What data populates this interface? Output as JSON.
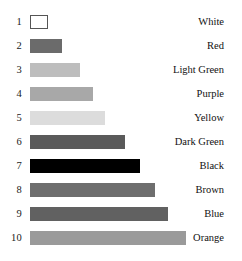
{
  "chart_data": {
    "type": "bar",
    "orientation": "horizontal",
    "title": "",
    "xlabel": "",
    "ylabel": "",
    "grid": false,
    "legend": "none",
    "categories": [
      "White",
      "Red",
      "Light Green",
      "Purple",
      "Yellow",
      "Dark Green",
      "Black",
      "Brown",
      "Blue",
      "Orange"
    ],
    "ranks": [
      "1",
      "2",
      "3",
      "4",
      "5",
      "6",
      "7",
      "8",
      "9",
      "10"
    ],
    "values": [
      18,
      32,
      50,
      63,
      75,
      95,
      110,
      125,
      138,
      156
    ],
    "xlim": [
      0,
      160
    ],
    "bar_fill_colors": [
      "#ffffff",
      "#6b6b6b",
      "#bdbdbd",
      "#a8a8a8",
      "#dcdcdc",
      "#5a5a5a",
      "#000000",
      "#6e6e6e",
      "#616161",
      "#9a9a9a"
    ],
    "bar_stroke_colors": [
      "#555555",
      "none",
      "none",
      "none",
      "none",
      "none",
      "none",
      "none",
      "none",
      "none"
    ]
  },
  "rows": [
    {
      "rank": "1",
      "label": "White",
      "value": 18,
      "fill": "#ffffff",
      "outlined": true
    },
    {
      "rank": "2",
      "label": "Red",
      "value": 32,
      "fill": "#6b6b6b",
      "outlined": false
    },
    {
      "rank": "3",
      "label": "Light Green",
      "value": 50,
      "fill": "#bdbdbd",
      "outlined": false
    },
    {
      "rank": "4",
      "label": "Purple",
      "value": 63,
      "fill": "#a8a8a8",
      "outlined": false
    },
    {
      "rank": "5",
      "label": "Yellow",
      "value": 75,
      "fill": "#dcdcdc",
      "outlined": false
    },
    {
      "rank": "6",
      "label": "Dark Green",
      "value": 95,
      "fill": "#5a5a5a",
      "outlined": false
    },
    {
      "rank": "7",
      "label": "Black",
      "value": 110,
      "fill": "#000000",
      "outlined": false
    },
    {
      "rank": "8",
      "label": "Brown",
      "value": 125,
      "fill": "#6e6e6e",
      "outlined": false
    },
    {
      "rank": "9",
      "label": "Blue",
      "value": 138,
      "fill": "#616161",
      "outlined": false
    },
    {
      "rank": "10",
      "label": "Orange",
      "value": 156,
      "fill": "#9a9a9a",
      "outlined": false
    }
  ],
  "layout": {
    "first_row_top": 14,
    "row_step": 24,
    "bar_left": 30
  }
}
